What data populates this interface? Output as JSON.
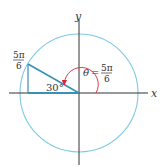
{
  "figure": {
    "type": "unit-circle-angle-diagram",
    "axes": {
      "x_label": "x",
      "y_label": "y"
    },
    "point_label": {
      "numerator": "5π",
      "denominator": "6"
    },
    "angle_label": {
      "symbol": "θ",
      "equals": "=",
      "numerator": "5π",
      "denominator": "6"
    },
    "reference_angle_label": "30°",
    "colors": {
      "circle": "#7ec8e3",
      "terminal_side": "#3a8fb7",
      "angle_arc": "#d9263c",
      "axes": "#333333"
    }
  }
}
